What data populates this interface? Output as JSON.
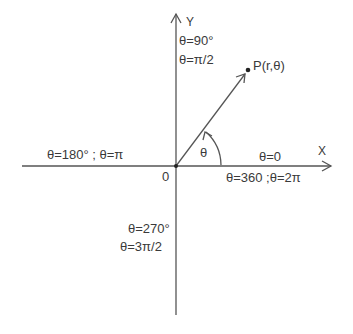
{
  "diagram": {
    "type": "polar-coordinate-system",
    "origin_label": "0",
    "x_axis_label": "X",
    "y_axis_label": "Y",
    "point_label": "P(r,θ)",
    "angle_label": "θ",
    "angles": {
      "deg90": "θ=90°",
      "rad90": "θ=π/2",
      "deg180": "θ=180° ; θ=π",
      "deg0": "θ=0",
      "deg360": "θ=360 ;θ=2π",
      "deg270": "θ=270°",
      "rad270": "θ=3π/2"
    },
    "colors": {
      "line": "#555555",
      "text": "#3a3a3a",
      "background": "#ffffff"
    }
  }
}
